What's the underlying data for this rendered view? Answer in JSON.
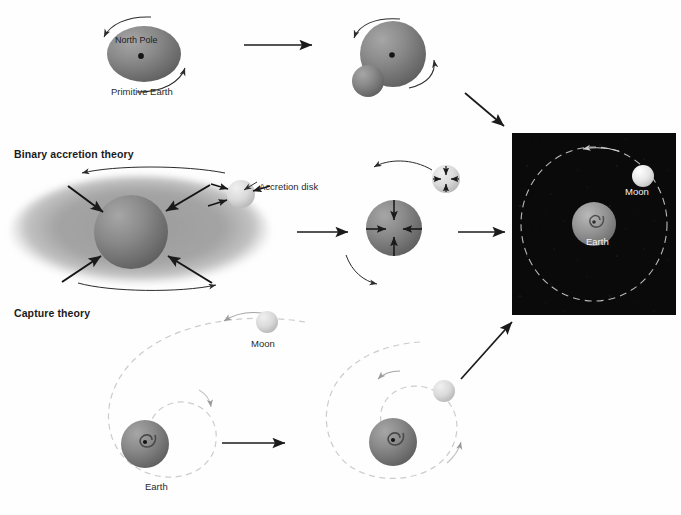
{
  "figure": {
    "background_color": "#ffffff",
    "ink_color": "#1b1b1b",
    "space_panel_color": "#0a0a0a",
    "earth_color": "#7d7d7d",
    "moon_color": "#d4d4d4",
    "disk_color": "#a8a8a8",
    "orbit_color": "#c9c9c9"
  },
  "theories": [
    {
      "id": "fission",
      "label": ""
    },
    {
      "id": "binary",
      "label": "Binary accretion theory"
    },
    {
      "id": "capture",
      "label": "Capture theory"
    }
  ],
  "labels": {
    "north_pole": "North Pole",
    "primitive_earth": "Primitive Earth",
    "accretion_disk": "Accretion disk",
    "moon_dark_panel": "Moon",
    "earth_dark_panel": "Earth",
    "moon_capture": "Moon",
    "earth_capture": "Earth"
  },
  "icons": {
    "straight_arrow": "arrow-right-icon",
    "diagonal_arrow_down": "arrow-down-right-icon",
    "diagonal_arrow_up": "arrow-up-right-icon",
    "rotation_arrow": "curved-rotation-arrow-icon",
    "infall_arrow": "inward-accretion-arrow-icon",
    "orbit_path": "dashed-orbit-path-icon",
    "spiral_path": "dashed-spiral-trajectory-icon",
    "earth_sphere": "earth-sphere-icon",
    "moon_sphere": "moon-sphere-icon",
    "accretion_disk": "accretion-disk-icon",
    "fission_bulge": "fission-bulge-icon",
    "pole_dot": "rotation-axis-dot-icon",
    "earth_swirl": "earth-swirl-icon"
  },
  "panels": {
    "fission_row": {
      "stage1": {
        "name": "primitive-earth-rotating"
      },
      "stage2": {
        "name": "earth-with-fission-bulge"
      }
    },
    "binary_row": {
      "stage1": {
        "name": "accretion-disk-around-proto-earth"
      },
      "stage2": {
        "name": "proto-earth-and-proto-moon-accreting"
      }
    },
    "capture_row": {
      "stage1": {
        "name": "moon-on-wide-approach-spiral"
      },
      "stage2": {
        "name": "moon-on-tightening-capture-spiral"
      }
    },
    "result": {
      "name": "earth-moon-system-in-space"
    }
  }
}
